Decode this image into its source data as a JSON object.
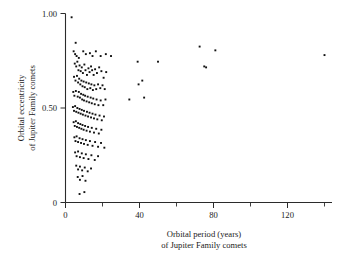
{
  "chart_data": {
    "type": "scatter",
    "title": "",
    "xlabel": "Orbital period (years) of Jupiter Family comets",
    "xlabel_line1": "Orbital period (years)",
    "xlabel_line2": "of Jupiter Family comets",
    "ylabel": "Orbital eccentricity of Jupiter Family comets",
    "ylabel_line1": "Orbital eccentricity",
    "ylabel_line2": "of Jupiter Family comets",
    "xlim": [
      0,
      148
    ],
    "ylim": [
      0,
      1.0
    ],
    "xticks": [
      0,
      40,
      80,
      120
    ],
    "xticklabels": [
      "0",
      "40",
      "80",
      "120"
    ],
    "xminorticks": [
      20,
      60,
      100,
      140
    ],
    "yticks": [
      0,
      0.5,
      1.0
    ],
    "yticklabels": [
      "0",
      "0.50",
      "1.00"
    ],
    "grid": false,
    "legend": null,
    "marker": "square",
    "marker_color": "#111111",
    "marker_size": 1.9,
    "points": [
      [
        3.3,
        0.98
      ],
      [
        5.5,
        0.845
      ],
      [
        4.4,
        0.8
      ],
      [
        5.2,
        0.785
      ],
      [
        6.0,
        0.775
      ],
      [
        7.2,
        0.765
      ],
      [
        9.6,
        0.8
      ],
      [
        11.0,
        0.785
      ],
      [
        13.2,
        0.79
      ],
      [
        14.6,
        0.775
      ],
      [
        16.4,
        0.8
      ],
      [
        19.0,
        0.775
      ],
      [
        21.8,
        0.785
      ],
      [
        24.6,
        0.775
      ],
      [
        5.0,
        0.735
      ],
      [
        5.8,
        0.72
      ],
      [
        6.4,
        0.745
      ],
      [
        7.0,
        0.7
      ],
      [
        7.6,
        0.725
      ],
      [
        8.2,
        0.695
      ],
      [
        8.8,
        0.715
      ],
      [
        9.4,
        0.685
      ],
      [
        10.2,
        0.73
      ],
      [
        10.8,
        0.7
      ],
      [
        11.6,
        0.675
      ],
      [
        12.4,
        0.71
      ],
      [
        13.0,
        0.69
      ],
      [
        13.8,
        0.72
      ],
      [
        14.4,
        0.7
      ],
      [
        15.2,
        0.675
      ],
      [
        16.0,
        0.705
      ],
      [
        17.0,
        0.685
      ],
      [
        18.2,
        0.715
      ],
      [
        19.4,
        0.695
      ],
      [
        20.6,
        0.66
      ],
      [
        22.0,
        0.69
      ],
      [
        4.6,
        0.665
      ],
      [
        5.4,
        0.645
      ],
      [
        6.2,
        0.67
      ],
      [
        6.8,
        0.635
      ],
      [
        7.4,
        0.655
      ],
      [
        8.0,
        0.625
      ],
      [
        8.6,
        0.645
      ],
      [
        9.2,
        0.615
      ],
      [
        9.8,
        0.64
      ],
      [
        10.4,
        0.61
      ],
      [
        11.2,
        0.635
      ],
      [
        11.8,
        0.6
      ],
      [
        12.6,
        0.63
      ],
      [
        13.4,
        0.605
      ],
      [
        14.0,
        0.625
      ],
      [
        14.8,
        0.595
      ],
      [
        15.6,
        0.62
      ],
      [
        16.6,
        0.6
      ],
      [
        17.6,
        0.625
      ],
      [
        18.8,
        0.605
      ],
      [
        20.0,
        0.62
      ],
      [
        21.2,
        0.6
      ],
      [
        4.2,
        0.585
      ],
      [
        4.8,
        0.565
      ],
      [
        5.6,
        0.59
      ],
      [
        6.6,
        0.56
      ],
      [
        7.2,
        0.585
      ],
      [
        7.8,
        0.555
      ],
      [
        8.4,
        0.575
      ],
      [
        9.0,
        0.545
      ],
      [
        9.6,
        0.57
      ],
      [
        10.0,
        0.54
      ],
      [
        10.6,
        0.565
      ],
      [
        11.4,
        0.535
      ],
      [
        12.0,
        0.56
      ],
      [
        12.8,
        0.53
      ],
      [
        13.6,
        0.555
      ],
      [
        14.2,
        0.525
      ],
      [
        15.0,
        0.55
      ],
      [
        15.8,
        0.52
      ],
      [
        16.8,
        0.545
      ],
      [
        17.8,
        0.515
      ],
      [
        19.0,
        0.54
      ],
      [
        20.4,
        0.515
      ],
      [
        21.6,
        0.545
      ],
      [
        4.0,
        0.505
      ],
      [
        4.6,
        0.485
      ],
      [
        5.2,
        0.51
      ],
      [
        5.8,
        0.48
      ],
      [
        6.4,
        0.5
      ],
      [
        7.0,
        0.475
      ],
      [
        7.6,
        0.495
      ],
      [
        8.2,
        0.47
      ],
      [
        8.8,
        0.49
      ],
      [
        9.4,
        0.465
      ],
      [
        10.0,
        0.485
      ],
      [
        10.8,
        0.46
      ],
      [
        11.6,
        0.48
      ],
      [
        12.2,
        0.455
      ],
      [
        13.0,
        0.475
      ],
      [
        13.8,
        0.45
      ],
      [
        14.6,
        0.47
      ],
      [
        15.4,
        0.445
      ],
      [
        16.2,
        0.465
      ],
      [
        17.2,
        0.44
      ],
      [
        18.4,
        0.46
      ],
      [
        19.6,
        0.435
      ],
      [
        20.8,
        0.455
      ],
      [
        4.4,
        0.425
      ],
      [
        5.0,
        0.405
      ],
      [
        5.6,
        0.43
      ],
      [
        6.2,
        0.4
      ],
      [
        6.8,
        0.42
      ],
      [
        7.4,
        0.395
      ],
      [
        8.0,
        0.415
      ],
      [
        8.6,
        0.39
      ],
      [
        9.2,
        0.41
      ],
      [
        9.8,
        0.385
      ],
      [
        10.6,
        0.405
      ],
      [
        11.4,
        0.38
      ],
      [
        12.2,
        0.4
      ],
      [
        13.2,
        0.375
      ],
      [
        14.2,
        0.395
      ],
      [
        15.4,
        0.37
      ],
      [
        16.6,
        0.39
      ],
      [
        18.0,
        0.365
      ],
      [
        19.4,
        0.385
      ],
      [
        4.8,
        0.345
      ],
      [
        5.4,
        0.325
      ],
      [
        6.0,
        0.35
      ],
      [
        6.8,
        0.32
      ],
      [
        7.6,
        0.34
      ],
      [
        8.4,
        0.315
      ],
      [
        9.2,
        0.335
      ],
      [
        10.0,
        0.31
      ],
      [
        11.0,
        0.33
      ],
      [
        12.0,
        0.305
      ],
      [
        13.2,
        0.325
      ],
      [
        14.6,
        0.3
      ],
      [
        16.0,
        0.32
      ],
      [
        17.6,
        0.295
      ],
      [
        19.2,
        0.315
      ],
      [
        21.0,
        0.29
      ],
      [
        5.2,
        0.265
      ],
      [
        6.0,
        0.245
      ],
      [
        6.8,
        0.27
      ],
      [
        7.8,
        0.24
      ],
      [
        8.8,
        0.26
      ],
      [
        9.8,
        0.235
      ],
      [
        11.0,
        0.255
      ],
      [
        12.4,
        0.23
      ],
      [
        14.0,
        0.25
      ],
      [
        15.8,
        0.225
      ],
      [
        17.6,
        0.245
      ],
      [
        5.8,
        0.195
      ],
      [
        6.8,
        0.175
      ],
      [
        7.8,
        0.19
      ],
      [
        9.0,
        0.17
      ],
      [
        10.4,
        0.185
      ],
      [
        12.0,
        0.165
      ],
      [
        13.8,
        0.18
      ],
      [
        6.6,
        0.135
      ],
      [
        7.8,
        0.12
      ],
      [
        9.2,
        0.14
      ],
      [
        10.8,
        0.115
      ],
      [
        7.6,
        0.045
      ],
      [
        10.2,
        0.055
      ],
      [
        34.5,
        0.545
      ],
      [
        39.0,
        0.745
      ],
      [
        39.5,
        0.625
      ],
      [
        41.5,
        0.645
      ],
      [
        42.5,
        0.555
      ],
      [
        50.0,
        0.745
      ],
      [
        72.5,
        0.825
      ],
      [
        75.0,
        0.72
      ],
      [
        76.0,
        0.715
      ],
      [
        81.0,
        0.805
      ],
      [
        140.0,
        0.78
      ]
    ]
  }
}
